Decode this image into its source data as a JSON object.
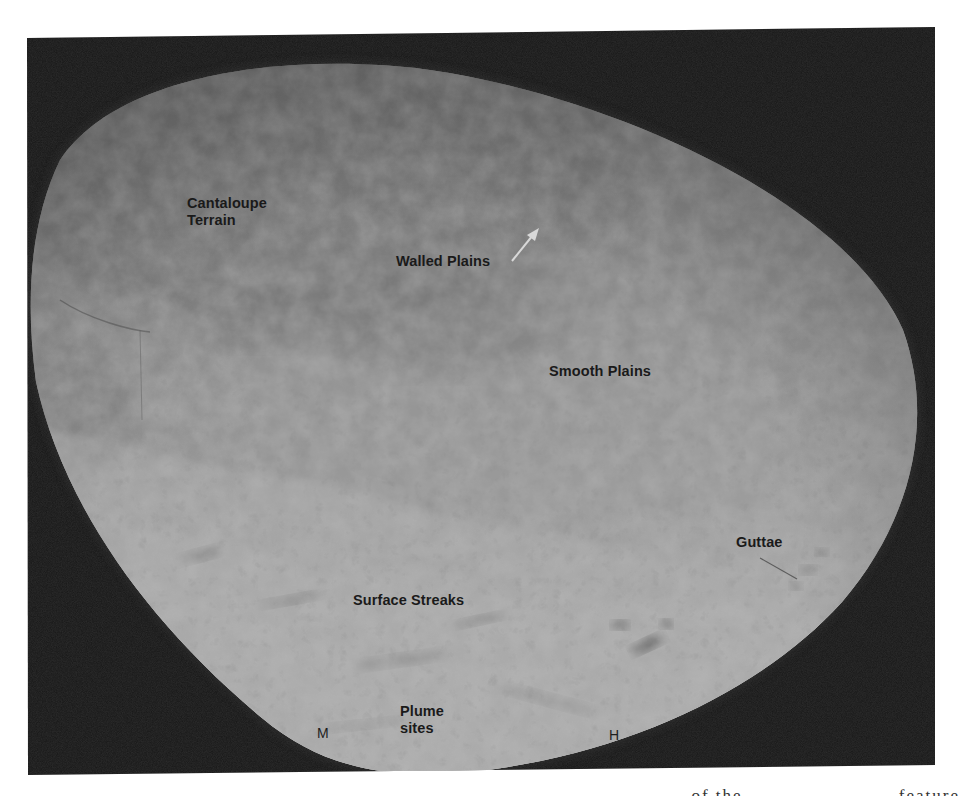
{
  "figure": {
    "colors": {
      "page_background": "#ffffff",
      "space_background": "#161616",
      "surface_dark": "#5f5f5f",
      "surface_mid": "#8e8e8e",
      "surface_light": "#c9c9c9",
      "label_text": "#1a1a1a",
      "arrow": "#d8d8d8"
    },
    "labels": [
      {
        "id": "cantaloupe-terrain",
        "text": "Cantaloupe\nTerrain",
        "x": 187,
        "y": 195
      },
      {
        "id": "walled-plains",
        "text": "Walled Plains",
        "x": 396,
        "y": 253
      },
      {
        "id": "smooth-plains",
        "text": "Smooth Plains",
        "x": 549,
        "y": 363
      },
      {
        "id": "guttae",
        "text": "Guttae",
        "x": 736,
        "y": 534
      },
      {
        "id": "surface-streaks",
        "text": "Surface Streaks",
        "x": 353,
        "y": 592
      },
      {
        "id": "plume-sites",
        "text": "Plume\nsites",
        "x": 400,
        "y": 703
      }
    ],
    "markers": [
      {
        "id": "marker-m",
        "text": "M",
        "x": 317,
        "y": 725
      },
      {
        "id": "marker-h",
        "text": "H",
        "x": 609,
        "y": 727
      }
    ],
    "arrow": {
      "from": [
        512,
        261
      ],
      "to": [
        538,
        229
      ]
    },
    "guttae_pointer": {
      "from": [
        760,
        558
      ],
      "to": [
        797,
        579
      ]
    },
    "caption_fragment": "... of the ... ... ... ... ... ... feature"
  }
}
